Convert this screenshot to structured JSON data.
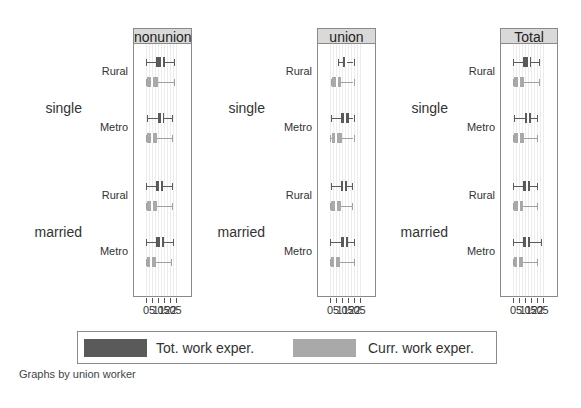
{
  "chart_data": {
    "type": "box",
    "title": "",
    "note": "Graphs by union worker",
    "xlabel": "",
    "xticks": [
      0,
      5,
      10,
      15,
      20,
      25
    ],
    "xtick_labels": [
      "0",
      "5",
      "10",
      "15",
      "20",
      "25"
    ],
    "xlim": [
      0,
      25
    ],
    "grid": true,
    "legend": {
      "position": "bottom",
      "entries": [
        {
          "label": "Tot. work exper.",
          "color": "#5a5a5a"
        },
        {
          "label": "Curr. work exper.",
          "color": "#a9a9a9"
        }
      ]
    },
    "row_groups": [
      "single",
      "married"
    ],
    "row_subgroups": [
      "Rural",
      "Metro"
    ],
    "panels": [
      {
        "title": "nonunion",
        "rows": [
          {
            "group": "single",
            "sub": "Rural",
            "tot": {
              "min": 0.5,
              "q1": 9,
              "median": 13.5,
              "q3": 16,
              "max": 24
            },
            "curr": {
              "min": 0,
              "q1": 1.5,
              "median": 5,
              "q3": 10.5,
              "max": 24
            }
          },
          {
            "group": "single",
            "sub": "Metro",
            "tot": {
              "min": 1,
              "q1": 10,
              "median": 13.5,
              "q3": 15.5,
              "max": 22
            },
            "curr": {
              "min": 0,
              "q1": 1.5,
              "median": 5,
              "q3": 9.5,
              "max": 22
            }
          },
          {
            "group": "married",
            "sub": "Rural",
            "tot": {
              "min": 0.5,
              "q1": 9,
              "median": 12,
              "q3": 15,
              "max": 22
            },
            "curr": {
              "min": 0,
              "q1": 1.5,
              "median": 5,
              "q3": 9.5,
              "max": 22
            }
          },
          {
            "group": "married",
            "sub": "Metro",
            "tot": {
              "min": 0.5,
              "q1": 9,
              "median": 12.5,
              "q3": 15.5,
              "max": 23
            },
            "curr": {
              "min": 0,
              "q1": 1.5,
              "median": 4.5,
              "q3": 9,
              "max": 21
            }
          }
        ]
      },
      {
        "title": "union",
        "rows": [
          {
            "group": "single",
            "sub": "Rural",
            "tot": {
              "min": 7,
              "q1": 11,
              "median": 13.5,
              "q3": 15,
              "max": 20
            },
            "curr": {
              "min": 1.5,
              "q1": 2,
              "median": 6,
              "q3": 9.5,
              "max": 20
            }
          },
          {
            "group": "single",
            "sub": "Metro",
            "tot": {
              "min": 1,
              "q1": 9.5,
              "median": 13,
              "q3": 16,
              "max": 20
            },
            "curr": {
              "min": 0.5,
              "q1": 2,
              "median": 5.5,
              "q3": 10.5,
              "max": 20
            }
          },
          {
            "group": "married",
            "sub": "Rural",
            "tot": {
              "min": 1,
              "q1": 9.5,
              "median": 12,
              "q3": 15,
              "max": 19
            },
            "curr": {
              "min": 0.5,
              "q1": 1.5,
              "median": 5.5,
              "q3": 10,
              "max": 19
            }
          },
          {
            "group": "married",
            "sub": "Metro",
            "tot": {
              "min": 0,
              "q1": 9.5,
              "median": 12.5,
              "q3": 15.5,
              "max": 20
            },
            "curr": {
              "min": 0,
              "q1": 1.5,
              "median": 4.5,
              "q3": 8.5,
              "max": 20
            }
          }
        ]
      },
      {
        "title": "Total",
        "rows": [
          {
            "group": "single",
            "sub": "Rural",
            "tot": {
              "min": 0.5,
              "q1": 9,
              "median": 13.5,
              "q3": 15.5,
              "max": 22
            },
            "curr": {
              "min": 0,
              "q1": 1.5,
              "median": 5.5,
              "q3": 10,
              "max": 22
            }
          },
          {
            "group": "single",
            "sub": "Metro",
            "tot": {
              "min": 1,
              "q1": 10,
              "median": 13,
              "q3": 15.5,
              "max": 20.5
            },
            "curr": {
              "min": 0,
              "q1": 1.5,
              "median": 5,
              "q3": 9.5,
              "max": 20.5
            }
          },
          {
            "group": "married",
            "sub": "Rural",
            "tot": {
              "min": 0,
              "q1": 8.5,
              "median": 12,
              "q3": 14.5,
              "max": 20.5
            },
            "curr": {
              "min": 0,
              "q1": 1.5,
              "median": 5,
              "q3": 9,
              "max": 20
            }
          },
          {
            "group": "married",
            "sub": "Metro",
            "tot": {
              "min": 0,
              "q1": 8.5,
              "median": 12,
              "q3": 14.5,
              "max": 24
            },
            "curr": {
              "min": 0,
              "q1": 1.5,
              "median": 4.5,
              "q3": 8.5,
              "max": 20
            }
          }
        ]
      }
    ]
  },
  "labels": {
    "groups": [
      "single",
      "married"
    ],
    "subgroups": [
      "Rural",
      "Metro"
    ],
    "legend_tot": "Tot. work exper.",
    "legend_curr": "Curr. work exper.",
    "note": "Graphs by union worker",
    "panel_titles": [
      "nonunion",
      "union",
      "Total"
    ]
  },
  "colors": {
    "tot_fill": "#5a5a5a",
    "curr_fill": "#a9a9a9",
    "tot_line": "#5a5a5a",
    "curr_line": "#a0a0a0",
    "header_bg": "#d9d9d9",
    "frame": "#8a8a8a"
  }
}
